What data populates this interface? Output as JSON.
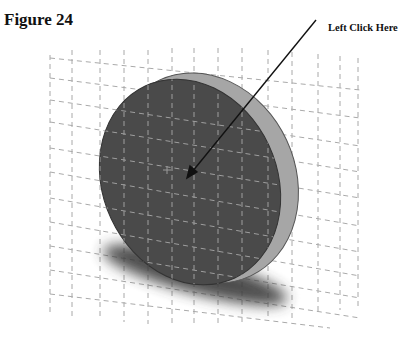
{
  "figure": {
    "title": "Figure 24",
    "callout_label": "Left Click Here"
  },
  "scene": {
    "object": "disk",
    "background": "#ffffff",
    "grid_color": "#9a9a9a",
    "face_color": "#4a4a4a",
    "rim_color": "#a6a6a6",
    "shadow_color": "#3a3a3a"
  }
}
